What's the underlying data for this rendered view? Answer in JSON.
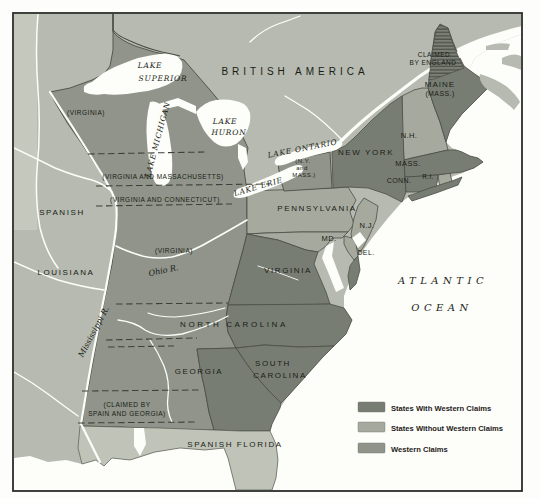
{
  "territories": {
    "british_america": "BRITISH AMERICA",
    "spanish": "SPANISH",
    "louisiana": "LOUISIANA",
    "spanish_florida": "SPANISH FLORIDA"
  },
  "states": {
    "new_york": "NEW YORK",
    "pennsylvania": "PENNSYLVANIA",
    "virginia": "VIRGINIA",
    "north_carolina": "NORTH CAROLINA",
    "south_carolina_1": "SOUTH",
    "south_carolina_2": "CAROLINA",
    "georgia": "GEORGIA",
    "maine_1": "MAINE",
    "maine_2": "(MASS.)",
    "nh": "N.H.",
    "mass": "MASS.",
    "conn": "CONN.",
    "ri": "R.I.",
    "nj": "N.J.",
    "md": "MD.",
    "del": "DEL."
  },
  "claims": {
    "virginia_nw": "(VIRGINIA)",
    "virginia_mass": "(VIRGINIA AND MASSACHUSETTS)",
    "virginia_conn": "(VIRGINIA AND CONNECTICUT)",
    "virginia_ky": "(VIRGINIA)",
    "ny_mass_1": "(N.Y.",
    "ny_mass_2": "and",
    "ny_mass_3": "MASS.)",
    "claimed_england_1": "CLAIMED",
    "claimed_england_2": "BY ENGLAND",
    "claimed_spain_1": "(CLAIMED BY",
    "claimed_spain_2": "SPAIN AND GEORGIA)"
  },
  "water": {
    "lake_superior_1": "LAKE",
    "lake_superior_2": "SUPERIOR",
    "lake_michigan": "LAKE MICHIGAN",
    "lake_huron_1": "LAKE",
    "lake_huron_2": "HURON",
    "lake_erie": "LAKE ERIE",
    "lake_ontario": "LAKE ONTARIO",
    "atlantic": "ATLANTIC",
    "ocean": "OCEAN",
    "ohio_river": "Ohio R.",
    "mississippi_river": "Mississippi R."
  },
  "legend": {
    "items": [
      {
        "label": "States With Western Claims",
        "color": "#787d74"
      },
      {
        "label": "States Without Western Claims",
        "color": "#a6aa9e"
      },
      {
        "label": "Western Claims",
        "color": "#90948a"
      }
    ]
  },
  "colors": {
    "foreign_territory": "#b6bab0",
    "spanish_florida": "#c0c4b8",
    "states_with_claims": "#787d74",
    "states_without_claims": "#a6aa9e",
    "western_claims": "#90948a",
    "water": "#fdfdfa",
    "boundary": "#4a4e45",
    "frame": "#2a2d28"
  }
}
